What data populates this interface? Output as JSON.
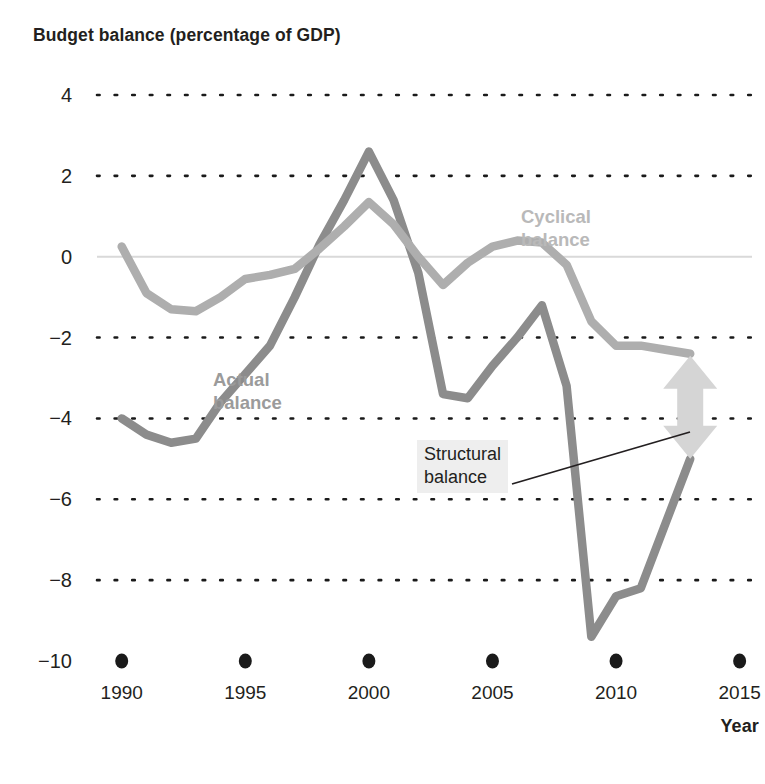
{
  "chart_data": {
    "type": "line",
    "title": "Budget balance (percentage of GDP)",
    "xlabel": "Year",
    "ylabel": "",
    "xlim": [
      1989,
      2015.5
    ],
    "ylim": [
      -10,
      4
    ],
    "grid": true,
    "grid_values": [
      4,
      2,
      -2,
      -4,
      -6,
      -8
    ],
    "zero_line": 0,
    "legend_position": "inline-annotations",
    "xticks": [
      "1990",
      "1995",
      "2000",
      "2005",
      "2010",
      "2015"
    ],
    "xtick_values": [
      1990,
      1995,
      2000,
      2005,
      2010,
      2015
    ],
    "yticks": [
      "4",
      "2",
      "0",
      "−2",
      "−4",
      "−6",
      "−8",
      "−10"
    ],
    "ytick_values": [
      4,
      2,
      0,
      -2,
      -4,
      -6,
      -8,
      -10
    ],
    "x": [
      1990,
      1991,
      1992,
      1993,
      1994,
      1995,
      1996,
      1997,
      1998,
      1999,
      2000,
      2001,
      2002,
      2003,
      2004,
      2005,
      2006,
      2007,
      2008,
      2009,
      2010,
      2011,
      2012,
      2013
    ],
    "series": [
      {
        "name": "Actual balance",
        "color": "#8c8c8c",
        "values": [
          -4.0,
          -4.4,
          -4.6,
          -4.5,
          -3.6,
          -2.9,
          -2.2,
          -1.0,
          0.3,
          1.4,
          2.6,
          1.4,
          -0.4,
          -3.4,
          -3.5,
          -2.7,
          -2.0,
          -1.2,
          -3.2,
          -9.4,
          -8.4,
          -8.2,
          -6.6,
          -5.0
        ]
      },
      {
        "name": "Cyclical balance",
        "color": "#aeaeae",
        "values": [
          0.25,
          -0.9,
          -1.3,
          -1.35,
          -1.0,
          -0.55,
          -0.45,
          -0.3,
          0.2,
          0.75,
          1.35,
          0.8,
          0.0,
          -0.7,
          -0.15,
          0.25,
          0.4,
          0.35,
          -0.2,
          -1.6,
          -2.2,
          -2.2,
          -2.3,
          -2.4
        ]
      }
    ],
    "annotations": [
      {
        "text": "Actual balance",
        "lines": [
          "Actual",
          "balance"
        ],
        "color": "#9b9b9b"
      },
      {
        "text": "Cyclical balance",
        "lines": [
          "Cyclical",
          "balance"
        ],
        "color": "#b9b9b9"
      },
      {
        "text": "Structural balance",
        "lines": [
          "Structural",
          "balance"
        ],
        "color": "#231f20"
      }
    ],
    "arrow": {
      "name": "structural-balance-arrow",
      "orientation": "double-headed-vertical",
      "x_value": 2013,
      "y_top": -2.45,
      "y_bottom": -5.0,
      "color": "#d5d5d5"
    }
  },
  "labels": {
    "title": "Budget balance (percentage of GDP)",
    "actual_line1": "Actual",
    "actual_line2": "balance",
    "cyclical_line1": "Cyclical",
    "cyclical_line2": "balance",
    "structural_line1": "Structural",
    "structural_line2": "balance",
    "year_axis": "Year"
  },
  "yticks": [
    {
      "label": "4"
    },
    {
      "label": "2"
    },
    {
      "label": "0"
    },
    {
      "label": "−2"
    },
    {
      "label": "−4"
    },
    {
      "label": "−6"
    },
    {
      "label": "−8"
    },
    {
      "label": "−10"
    }
  ],
  "xticks": [
    {
      "label": "1990"
    },
    {
      "label": "1995"
    },
    {
      "label": "2000"
    },
    {
      "label": "2005"
    },
    {
      "label": "2010"
    },
    {
      "label": "2015"
    }
  ]
}
